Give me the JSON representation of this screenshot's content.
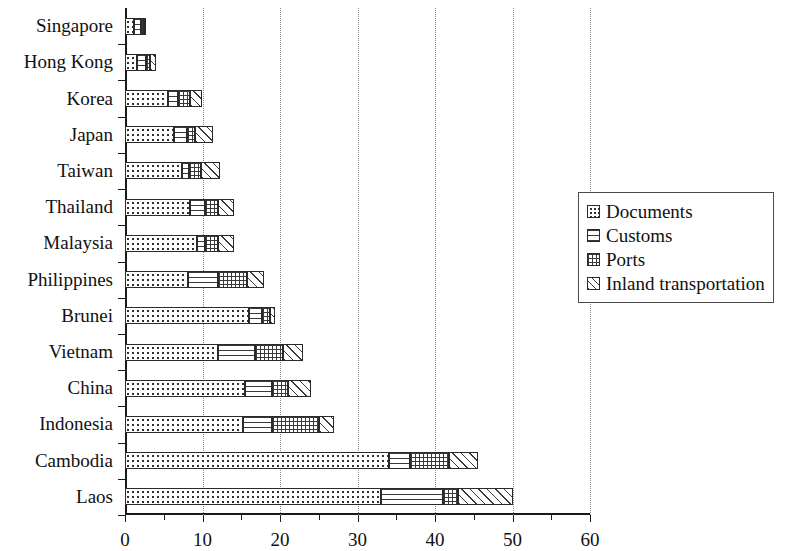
{
  "chart_data": {
    "type": "bar",
    "orientation": "horizontal",
    "stacked": true,
    "title": "",
    "xlabel": "",
    "ylabel": "",
    "xlim": [
      0,
      60
    ],
    "xticks": [
      0,
      10,
      20,
      30,
      40,
      50,
      60
    ],
    "xtick_labels": [
      "0",
      "10",
      "20",
      "30",
      "40",
      "50",
      "60"
    ],
    "minor_xticks": [
      5,
      15,
      25,
      35,
      45,
      55
    ],
    "grid": "vertical-dotted-at-major-ticks",
    "legend_position": "right",
    "categories": [
      "Singapore",
      "Hong Kong",
      "Korea",
      "Japan",
      "Taiwan",
      "Thailand",
      "Malaysia",
      "Philippines",
      "Brunei",
      "Vietnam",
      "China",
      "Indonesia",
      "Cambodia",
      "Laos"
    ],
    "series": [
      {
        "name": "Documents",
        "pattern": "dots",
        "values": [
          1.1,
          1.6,
          5.5,
          6.3,
          7.3,
          8.4,
          9.3,
          8.1,
          16.0,
          12.0,
          15.5,
          15.2,
          34.0,
          33.0
        ]
      },
      {
        "name": "Customs",
        "pattern": "horizontal-lines",
        "values": [
          1.0,
          1.1,
          1.3,
          1.7,
          0.9,
          1.9,
          1.0,
          3.9,
          1.7,
          4.8,
          3.5,
          3.8,
          2.8,
          8.0
        ]
      },
      {
        "name": "Ports",
        "pattern": "fine-grid",
        "values": [
          0.4,
          0.5,
          1.6,
          1.0,
          1.6,
          1.7,
          1.7,
          3.8,
          1.0,
          3.6,
          2.0,
          6.0,
          5.0,
          2.0
        ]
      },
      {
        "name": "Inland transportation",
        "pattern": "diagonal-hatch",
        "values": [
          0.2,
          0.8,
          1.6,
          2.3,
          2.4,
          2.0,
          2.0,
          2.2,
          0.6,
          2.6,
          3.0,
          2.0,
          3.7,
          7.0
        ]
      }
    ],
    "totals": [
      2.7,
      4.0,
      10.0,
      11.3,
      12.2,
      14.0,
      14.0,
      18.0,
      19.3,
      23.0,
      24.0,
      27.0,
      45.5,
      50.0
    ]
  },
  "legend": {
    "items": [
      {
        "label": "Documents"
      },
      {
        "label": "Customs"
      },
      {
        "label": "Ports"
      },
      {
        "label": "Inland transportation"
      }
    ]
  }
}
